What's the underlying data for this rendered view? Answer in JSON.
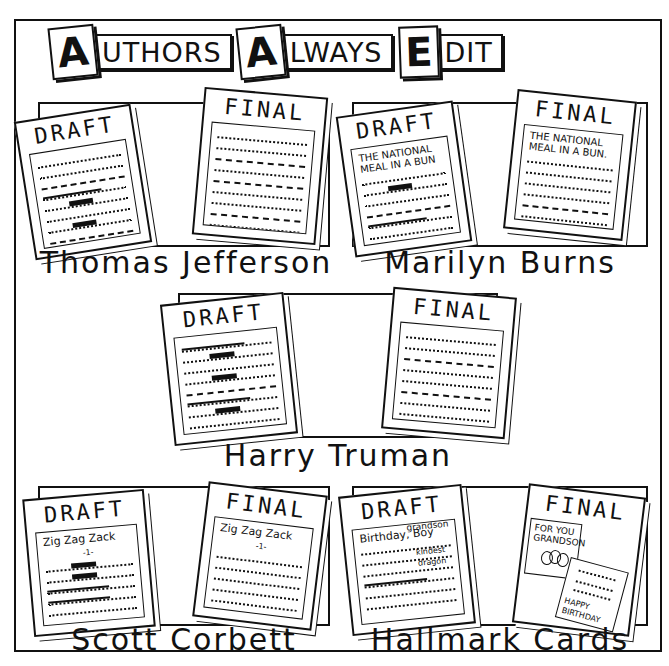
{
  "title": {
    "words": [
      {
        "cap": "A",
        "rest": "UTHORS"
      },
      {
        "cap": "A",
        "rest": "LWAYS"
      },
      {
        "cap": "E",
        "rest": "DIT"
      }
    ],
    "full": "Authors Always Edit"
  },
  "panels": [
    {
      "author": "Thomas Jefferson",
      "draft": {
        "label": "DRAFT",
        "heading": ""
      },
      "final": {
        "label": "FINAL",
        "heading": ""
      }
    },
    {
      "author": "Marilyn Burns",
      "draft": {
        "label": "DRAFT",
        "heading": "THE NATIONAL MEAL IN A BUN"
      },
      "final": {
        "label": "FINAL",
        "heading": "THE NATIONAL MEAL IN A BUN."
      }
    },
    {
      "author": "Harry Truman",
      "draft": {
        "label": "DRAFT",
        "heading": ""
      },
      "final": {
        "label": "FINAL",
        "heading": ""
      }
    },
    {
      "author": "Scott Corbett",
      "draft": {
        "label": "DRAFT",
        "heading": "Zig Zag Zack",
        "page": "-1-"
      },
      "final": {
        "label": "FINAL",
        "heading": "Zig Zag Zack",
        "page": "-1-"
      }
    },
    {
      "author": "Hallmark Cards",
      "draft": {
        "label": "DRAFT",
        "heading": "Birthday, Boy",
        "insert_top": "grandson",
        "insert_mid": "kindest",
        "insert_low": "dragon"
      },
      "final": {
        "label": "FINAL",
        "card_front": "FOR YOU GRANDSON",
        "card_inside": "HAPPY BIRTHDAY"
      }
    }
  ]
}
